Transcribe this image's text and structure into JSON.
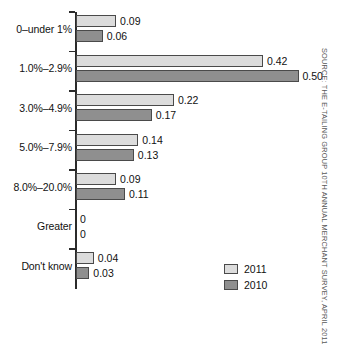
{
  "chart_data": {
    "type": "bar",
    "orientation": "horizontal",
    "title": "",
    "xlabel": "",
    "ylabel": "",
    "xlim": [
      0,
      0.5
    ],
    "grid": false,
    "legend_position": "bottom-right",
    "categories": [
      "0–under 1%",
      "1.0%–2.9%",
      "3.0%–4.9%",
      "5.0%–7.9%",
      "8.0%–20.0%",
      "Greater",
      "Don't know"
    ],
    "series": [
      {
        "name": "2011",
        "color": "#dcdcdc",
        "values": [
          0.09,
          0.42,
          0.22,
          0.14,
          0.09,
          0,
          0.04
        ],
        "labels": [
          "0.09",
          "0.42",
          "0.22",
          "0.14",
          "0.09",
          "0",
          "0.04"
        ]
      },
      {
        "name": "2010",
        "color": "#8f8f8f",
        "values": [
          0.06,
          0.5,
          0.17,
          0.13,
          0.11,
          0,
          0.03
        ],
        "labels": [
          "0.06",
          "0.50",
          "0.17",
          "0.13",
          "0.11",
          "0",
          "0.03"
        ]
      }
    ],
    "source_note": "Source: The e-tailing group 10th Annual Merchant Survey, April 2011"
  },
  "legend": {
    "items": [
      {
        "label": "2011",
        "color": "#dcdcdc"
      },
      {
        "label": "2010",
        "color": "#8f8f8f"
      }
    ]
  },
  "colors": {
    "series_2011": "#dcdcdc",
    "series_2010": "#8f8f8f",
    "axis": "#2b2b2b",
    "text": "#111111",
    "source_text": "#585858",
    "background": "#ffffff"
  }
}
